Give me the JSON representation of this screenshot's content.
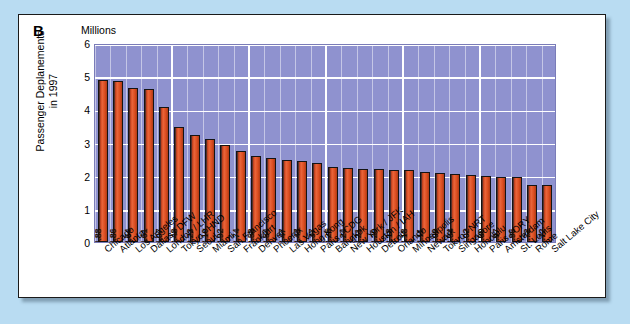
{
  "panel": {
    "letter": "B"
  },
  "axis": {
    "unit_label": "Millions",
    "y_title_line1": "Passenger Deplanements",
    "y_title_line2": "in 1997",
    "y_ticks": [
      "6",
      "5",
      "4",
      "3",
      "2",
      "1",
      "0"
    ]
  },
  "colors": {
    "page_background": "#b9dcf2",
    "card_background": "#ffffff",
    "plot_background": "#8f92cf",
    "bar_fill": "#d8491f",
    "bar_shadow": "#57302a",
    "gridline": "#ffffff",
    "text": "#000000"
  },
  "chart_data": {
    "type": "bar",
    "title": "B",
    "xlabel": "",
    "ylabel": "Passenger Deplanements in 1997",
    "unit": "Millions",
    "ylim": [
      0,
      6
    ],
    "ytick_step": 1,
    "grid": true,
    "legend": "none",
    "orientation": "vertical",
    "value_labels_rotated": true,
    "categories": [
      "Chicago",
      "Atlanta",
      "Los Angeles",
      "Dallas / DFW",
      "London / LHR",
      "Tokyo / HND",
      "Seoul",
      "Miami",
      "San Francisco",
      "Frankfurt",
      "Denver",
      "Phoenix",
      "Las Vegas",
      "Hong Kong",
      "Paris / CDG",
      "Bangkok",
      "New York / JFK",
      "Houston / IAH",
      "Detroit",
      "Orlando",
      "Minneapolis",
      "Newark",
      "Tokyo / NRT",
      "Singapore",
      "Honolulu",
      "Paris / ORY",
      "Amsterdam",
      "St. Louis",
      "Rome",
      "Salt Lake City"
    ],
    "values": [
      4.88,
      4.86,
      4.64,
      4.61,
      4.07,
      3.48,
      3.23,
      3.1,
      2.92,
      2.74,
      2.58,
      2.54,
      2.47,
      2.43,
      2.37,
      2.25,
      2.24,
      2.21,
      2.2,
      2.18,
      2.18,
      2.11,
      2.09,
      2.04,
      2.02,
      2.0,
      1.97,
      1.96,
      1.72,
      1.72
    ],
    "value_labels": [
      "4.88",
      "4.86",
      "4.64",
      "4.61",
      "4.07",
      "3.48",
      "3.23",
      "3.10",
      "2.92",
      "2.74",
      "2.58",
      "2.54",
      "2.47",
      "2.43",
      "2.37",
      "2.25",
      "2.24",
      "2.21",
      "2.20",
      "2.18",
      "2.18",
      "2.11",
      "2.09",
      "2.04",
      "2.02",
      "2.00",
      "1.97",
      "1.96",
      "1.72",
      "1.72"
    ]
  }
}
